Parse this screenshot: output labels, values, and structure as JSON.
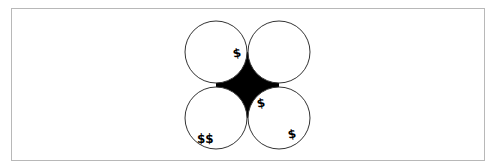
{
  "diagram": {
    "colors": {
      "stroke": "#333333",
      "fill_gap": "#000000",
      "background": "#ffffff",
      "frame_border": "#b8b8b8"
    },
    "circles": [
      {
        "id": "top-left",
        "cx": 216,
        "cy": 52,
        "r": 31
      },
      {
        "id": "top-right",
        "cx": 279,
        "cy": 52,
        "r": 31
      },
      {
        "id": "bottom-left",
        "cx": 216,
        "cy": 118,
        "r": 31
      },
      {
        "id": "bottom-right",
        "cx": 279,
        "cy": 118,
        "r": 31
      }
    ],
    "markers": [
      {
        "id": "marker-top-left",
        "text": "$",
        "x": 238,
        "y": 54
      },
      {
        "id": "marker-center-right",
        "text": "$",
        "x": 262,
        "y": 104
      },
      {
        "id": "marker-bottom-left",
        "text": "$$",
        "x": 205,
        "y": 140
      },
      {
        "id": "marker-bottom-right",
        "text": "$",
        "x": 293,
        "y": 135
      }
    ]
  }
}
